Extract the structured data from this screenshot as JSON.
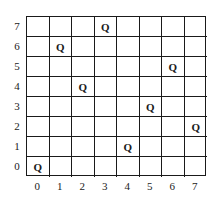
{
  "board": {
    "size": 8,
    "piece_symbol": "Q",
    "row_labels": [
      "7",
      "6",
      "5",
      "4",
      "3",
      "2",
      "1",
      "0"
    ],
    "col_labels": [
      "0",
      "1",
      "2",
      "3",
      "4",
      "5",
      "6",
      "7"
    ],
    "queens": [
      {
        "row": 7,
        "col": 3
      },
      {
        "row": 6,
        "col": 1
      },
      {
        "row": 5,
        "col": 6
      },
      {
        "row": 4,
        "col": 2
      },
      {
        "row": 3,
        "col": 5
      },
      {
        "row": 2,
        "col": 7
      },
      {
        "row": 1,
        "col": 4
      },
      {
        "row": 0,
        "col": 0
      }
    ],
    "line_color": "#1a1a1a",
    "background": "#ffffff"
  }
}
